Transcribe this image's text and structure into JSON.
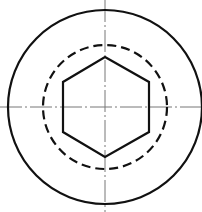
{
  "drawing": {
    "title": "Hexagon socket head — end view",
    "colors": {
      "outline": "#111111",
      "centerline": "#777777",
      "background": "#ffffff"
    },
    "center": {
      "x": 105,
      "y": 107
    },
    "outer_circle": {
      "r": 97,
      "style": "solid",
      "stroke_width": 2.2
    },
    "hidden_circle": {
      "r": 62,
      "style": "dashed",
      "dash": "9 5",
      "stroke_width": 2.2
    },
    "hexagon": {
      "orientation": "pointy-top",
      "points": "105,57 149,82 149,132 105,157 63,132 63,82",
      "stroke_width": 2.2
    },
    "centerlines": {
      "horizontal": {
        "x1": 0,
        "y1": 107,
        "x2": 202,
        "y2": 107
      },
      "vertical": {
        "x1": 105,
        "y1": 0,
        "x2": 105,
        "y2": 212
      },
      "dash": "22 3 2 3",
      "stroke_width": 1
    }
  }
}
